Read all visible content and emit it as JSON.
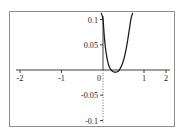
{
  "figure": {
    "frame": {
      "visible": true,
      "color": "#8e8e8e"
    },
    "background": "#ffffff",
    "curve_color": "#1a1a1a",
    "axis_color": "#2b2b2b"
  },
  "chart_data": {
    "type": "line",
    "title": "",
    "xlabel": "",
    "ylabel": "",
    "xlim": [
      -2.35,
      2.35
    ],
    "ylim": [
      -0.115,
      0.115
    ],
    "grid": false,
    "legend": null,
    "x_ticks": [
      -2,
      -1,
      0,
      1,
      2
    ],
    "x_tick_labels": [
      "-2",
      "-1",
      "0",
      "1",
      "2"
    ],
    "y_ticks": [
      0.1,
      0.05,
      -0.05,
      -0.1
    ],
    "y_tick_labels": [
      "0.1",
      "0.05",
      "-0.05",
      "-0.1"
    ],
    "series": [
      {
        "name": "curve",
        "x": [
          -0.04,
          0.0,
          0.03,
          0.06,
          0.09,
          0.12,
          0.15,
          0.18,
          0.21,
          0.24,
          0.27,
          0.3,
          0.33,
          0.36,
          0.39,
          0.42,
          0.45,
          0.48,
          0.51,
          0.54,
          0.57,
          0.6,
          0.63,
          0.66,
          0.69,
          0.72
        ],
        "y": [
          0.112,
          0.1,
          0.068,
          0.044,
          0.027,
          0.015,
          0.007,
          0.002,
          -0.001,
          -0.003,
          -0.004,
          -0.004,
          -0.004,
          -0.003,
          -0.001,
          0.003,
          0.008,
          0.014,
          0.022,
          0.032,
          0.044,
          0.058,
          0.074,
          0.09,
          0.104,
          0.112
        ]
      }
    ]
  }
}
